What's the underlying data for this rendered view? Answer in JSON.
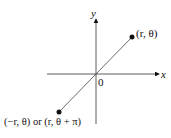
{
  "axes": {
    "x_label": "x",
    "y_label": "y",
    "origin_label": "0"
  },
  "points": [
    {
      "label": "(r, θ)"
    },
    {
      "label": "(−r, θ) or (r, θ + π)"
    }
  ],
  "colors": {
    "ink": "#111111",
    "line": "#444444"
  }
}
